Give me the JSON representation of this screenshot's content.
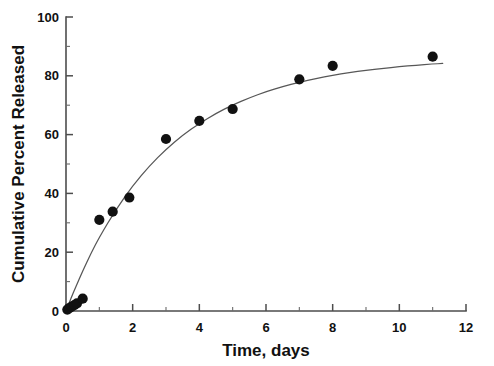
{
  "chart_data": {
    "type": "scatter",
    "title": "",
    "subtitle": "",
    "xlabel": "Time, days",
    "ylabel": "Cumulative Percent Released",
    "xlim": [
      0,
      12
    ],
    "ylim": [
      0,
      100
    ],
    "xticks": [
      0,
      2,
      4,
      6,
      8,
      10,
      12
    ],
    "xtick_labels": [
      "0",
      "2",
      "4",
      "6",
      "8",
      "10",
      "12"
    ],
    "xticks_minor": [
      1,
      3,
      5,
      7,
      9,
      11
    ],
    "yticks": [
      0,
      20,
      40,
      60,
      80,
      100
    ],
    "ytick_labels": [
      "0",
      "20",
      "40",
      "60",
      "80",
      "100"
    ],
    "yticks_minor": [
      10,
      30,
      50,
      70,
      90
    ],
    "grid": false,
    "legend": null,
    "legend_position": "none",
    "marker_color": "#111111",
    "curve_color": "#575757",
    "axis_color": "#4d4d4d",
    "background_color": "#ffffff",
    "series": [
      {
        "name": "Cumulative percent released",
        "kind": "scatter",
        "marker": "filled-circle",
        "x": [
          0.04,
          0.1,
          0.17,
          0.25,
          0.33,
          0.5,
          1.0,
          1.4,
          1.9,
          3.0,
          4.0,
          5.0,
          7.0,
          8.0,
          11.0
        ],
        "y": [
          0.5,
          1.0,
          1.5,
          2.0,
          2.6,
          4.2,
          31.0,
          33.8,
          38.6,
          58.5,
          64.7,
          68.7,
          78.8,
          83.4,
          86.5
        ]
      },
      {
        "name": "Fitted first-order release curve",
        "kind": "line",
        "model": "y = 88.5 * (1 - exp(-t / 3.05))",
        "x": [
          0.0,
          0.15,
          0.3,
          0.5,
          0.75,
          1.0,
          1.5,
          2.0,
          2.5,
          3.0,
          3.5,
          4.0,
          4.5,
          5.0,
          5.5,
          6.0,
          6.5,
          7.0,
          7.5,
          8.0,
          8.5,
          9.0,
          9.5,
          10.0,
          10.5,
          11.0,
          11.3
        ],
        "y": [
          0.0,
          4.3,
          8.4,
          13.6,
          19.6,
          25.1,
          34.6,
          42.6,
          49.3,
          55.0,
          59.8,
          63.8,
          67.2,
          70.1,
          72.5,
          74.6,
          76.3,
          77.8,
          79.1,
          80.2,
          81.1,
          81.9,
          82.5,
          83.1,
          83.6,
          84.0,
          84.2
        ]
      }
    ]
  },
  "axes": {
    "x_title": "Time, days",
    "y_title": "Cumulative Percent Released"
  }
}
